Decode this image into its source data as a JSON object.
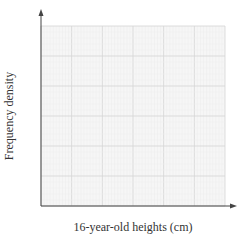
{
  "chart_data": {
    "type": "bar",
    "subtype": "histogram",
    "title": "",
    "xlabel": "16-year-old heights (cm)",
    "ylabel": "Frequency density",
    "xlim": [
      130,
      190
    ],
    "ylim": [
      0,
      3
    ],
    "x_ticks": [
      130,
      140,
      150,
      160,
      170,
      180,
      190
    ],
    "x_tick_labels": [
      "130",
      "140",
      "150",
      "160",
      "170",
      "180",
      "190"
    ],
    "y_ticks": [
      0,
      0.5,
      1,
      1.5,
      2,
      2.5,
      3
    ],
    "y_tick_labels": [
      "0",
      "0.5",
      "1",
      "1.5",
      "2",
      "2.5",
      "3"
    ],
    "grid": true,
    "legend": null,
    "bins": [
      {
        "from": 130,
        "to": 140,
        "value": 0.1
      },
      {
        "from": 140,
        "to": 150,
        "value": 0.9
      },
      {
        "from": 150,
        "to": 155,
        "value": 1.8
      },
      {
        "from": 155,
        "to": 160,
        "value": 2.4
      },
      {
        "from": 160,
        "to": 165,
        "value": 2.8
      },
      {
        "from": 165,
        "to": 170,
        "value": 2.6
      },
      {
        "from": 170,
        "to": 180,
        "value": 1.5
      },
      {
        "from": 180,
        "to": 190,
        "value": 0.1
      }
    ],
    "categories": [
      "130-140",
      "140-150",
      "150-155",
      "155-160",
      "160-165",
      "165-170",
      "170-180",
      "180-190"
    ],
    "values": [
      0.1,
      0.9,
      1.8,
      2.4,
      2.8,
      2.6,
      1.5,
      0.1
    ]
  },
  "colors": {
    "bar_fill": "#e3e3e3",
    "bar_stroke": "#6b6b6b",
    "grid_major": "#d4d4d4",
    "grid_minor": "#ececec",
    "axis": "#444444",
    "text": "#333333"
  }
}
